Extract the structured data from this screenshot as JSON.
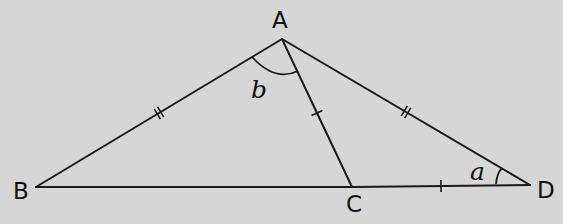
{
  "diagram": {
    "vertices": {
      "A": {
        "label": "A"
      },
      "B": {
        "label": "B"
      },
      "C": {
        "label": "C"
      },
      "D": {
        "label": "D"
      }
    },
    "segments": [
      {
        "name": "AB",
        "from": "A",
        "to": "B",
        "marks": 2
      },
      {
        "name": "AD",
        "from": "A",
        "to": "D",
        "marks": 2
      },
      {
        "name": "AC",
        "from": "A",
        "to": "C",
        "marks": 1
      },
      {
        "name": "BC",
        "from": "B",
        "to": "C",
        "marks": 0
      },
      {
        "name": "CD",
        "from": "C",
        "to": "D",
        "marks": 1
      }
    ],
    "angles": [
      {
        "name": "angle-b",
        "label": "b",
        "vertex": "A",
        "between": [
          "B",
          "C"
        ]
      },
      {
        "name": "angle-a",
        "label": "a",
        "vertex": "D",
        "between": [
          "C",
          "A"
        ]
      }
    ],
    "colors": {
      "background": "#d6d6d6",
      "ink": "#1a1a1a"
    }
  }
}
